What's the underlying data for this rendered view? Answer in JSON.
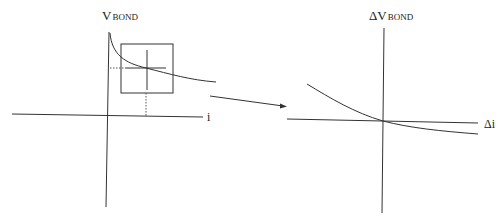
{
  "left_plot": {
    "y_axis_label_main": "V",
    "y_axis_label_sub": "BOND",
    "x_axis_label": "i"
  },
  "right_plot": {
    "y_axis_label_main": "ΔV",
    "y_axis_label_sub": "BOND",
    "x_axis_label": "Δi"
  },
  "colors": {
    "line": "#333333",
    "background": "#ffffff"
  }
}
